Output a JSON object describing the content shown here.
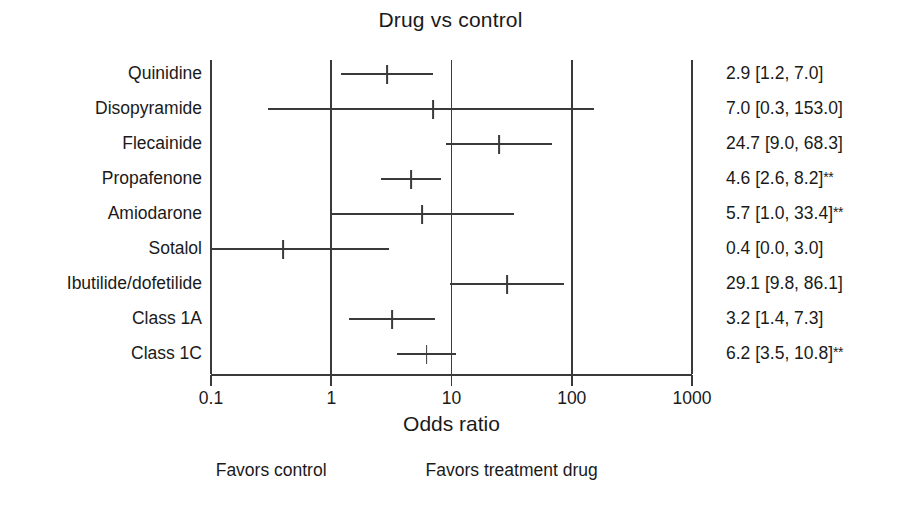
{
  "chart_data": {
    "type": "scatter",
    "subtype": "forest-plot",
    "title": "Drug vs control",
    "xlabel": "Odds ratio",
    "ylabel": "",
    "xscale": "log",
    "xlim": [
      0.1,
      1000
    ],
    "xticks": [
      0.1,
      1,
      10,
      100,
      1000
    ],
    "xtick_labels": [
      "0.1",
      "1",
      "10",
      "100",
      "1000"
    ],
    "grid": false,
    "reference_lines": [
      1,
      10,
      100
    ],
    "null_line": 1,
    "legend": "none",
    "annotations": {
      "left_side": "Favors control",
      "right_side": "Favors treatment drug",
      "significance_marker": "**"
    },
    "categories": [
      "Quinidine",
      "Disopyramide",
      "Flecainide",
      "Propafenone",
      "Amiodarone",
      "Sotalol",
      "Ibutilide/dofetilide",
      "Class 1A",
      "Class 1C"
    ],
    "rows": [
      {
        "label": "Quinidine",
        "estimate": 2.9,
        "ci_low": 1.2,
        "ci_high": 7.0,
        "significant": false,
        "text": "2.9 [1.2, 7.0]",
        "sig_mark": ""
      },
      {
        "label": "Disopyramide",
        "estimate": 7.0,
        "ci_low": 0.3,
        "ci_high": 153.0,
        "significant": false,
        "text": "7.0 [0.3, 153.0]",
        "sig_mark": ""
      },
      {
        "label": "Flecainide",
        "estimate": 24.7,
        "ci_low": 9.0,
        "ci_high": 68.3,
        "significant": false,
        "text": "24.7 [9.0, 68.3]",
        "sig_mark": ""
      },
      {
        "label": "Propafenone",
        "estimate": 4.6,
        "ci_low": 2.6,
        "ci_high": 8.2,
        "significant": true,
        "text": "4.6 [2.6, 8.2]",
        "sig_mark": "**"
      },
      {
        "label": "Amiodarone",
        "estimate": 5.7,
        "ci_low": 1.0,
        "ci_high": 33.4,
        "significant": true,
        "text": "5.7 [1.0, 33.4]",
        "sig_mark": "**"
      },
      {
        "label": "Sotalol",
        "estimate": 0.4,
        "ci_low": 0.0,
        "ci_high": 3.0,
        "significant": false,
        "text": "0.4 [0.0, 3.0]",
        "sig_mark": "",
        "ci_low_clipped": true
      },
      {
        "label": "Ibutilide/dofetilide",
        "estimate": 29.1,
        "ci_low": 9.8,
        "ci_high": 86.1,
        "significant": false,
        "text": "29.1 [9.8, 86.1]",
        "sig_mark": ""
      },
      {
        "label": "Class 1A",
        "estimate": 3.2,
        "ci_low": 1.4,
        "ci_high": 7.3,
        "significant": false,
        "text": "3.2 [1.4, 7.3]",
        "sig_mark": ""
      },
      {
        "label": "Class 1C",
        "estimate": 6.2,
        "ci_low": 3.5,
        "ci_high": 10.8,
        "significant": true,
        "text": "6.2 [3.5, 10.8]",
        "sig_mark": "**"
      }
    ]
  },
  "colors": {
    "line": "#3a3a3a",
    "text": "#1a1a1a",
    "background": "#ffffff"
  },
  "geometry": {
    "plot_left": 211,
    "plot_right": 692,
    "plot_top": 60,
    "axis_y": 374,
    "row_top": 74,
    "row_step": 35,
    "decade_px": 120.25
  }
}
